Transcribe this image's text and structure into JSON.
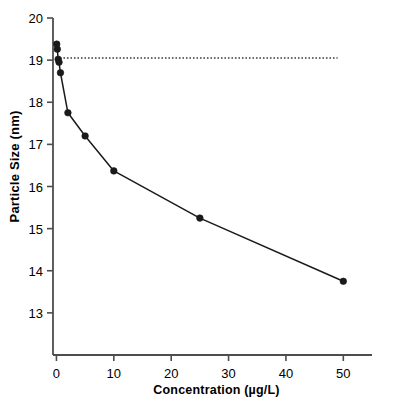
{
  "chart_data": {
    "type": "line",
    "title": "",
    "xlabel": "Concentration (µg/L)",
    "ylabel": "Particle Size (nm)",
    "xlim": [
      -0.6,
      55.0
    ],
    "ylim": [
      12.0,
      20.0
    ],
    "xticks": [
      0,
      10,
      20,
      30,
      40,
      50
    ],
    "xticklabels": [
      "0",
      "10",
      "20",
      "30",
      "40",
      "50"
    ],
    "yticks": [
      13,
      14,
      15,
      16,
      17,
      18,
      19,
      20
    ],
    "yticklabels": [
      "13",
      "14",
      "15",
      "16",
      "17",
      "18",
      "19",
      "20"
    ],
    "grid": false,
    "legend": null,
    "series": [
      {
        "name": "Particle size vs concentration",
        "marker": "filled-circle",
        "line_style": "solid",
        "color": "#1a1a1a",
        "x": [
          0.05,
          0.15,
          0.3,
          0.45,
          0.7,
          2.0,
          5.0,
          10.0,
          25.0,
          50.0
        ],
        "y": [
          19.38,
          19.26,
          19.02,
          18.95,
          18.7,
          17.75,
          17.2,
          16.37,
          15.25,
          13.75
        ]
      }
    ],
    "reference_lines": [
      {
        "name": "control-reference-line",
        "orientation": "horizontal",
        "y": 19.05,
        "x_start": 0.0,
        "x_end": 49.0,
        "style": "dotted",
        "color": "#3a3a3a"
      }
    ],
    "axis_color": "#4d4d4d",
    "background": "#ffffff"
  },
  "axes": {
    "y_axis_title": "Particle Size (nm)",
    "x_axis_title": "Concentration (µg/L)"
  }
}
